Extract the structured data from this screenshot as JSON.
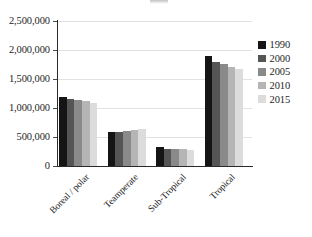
{
  "chart_data": {
    "type": "bar",
    "title": "",
    "subtitle": "",
    "xlabel": "",
    "ylabel": "",
    "categories": [
      "Boreal / polar",
      "Teamperate",
      "Sub-Tropical",
      "Tropical"
    ],
    "series": [
      {
        "name": "1990",
        "color": "#151515",
        "values": [
          1190000,
          580000,
          330000,
          1900000
        ]
      },
      {
        "name": "2000",
        "color": "#555555",
        "values": [
          1160000,
          590000,
          300000,
          1800000
        ]
      },
      {
        "name": "2005",
        "color": "#8a8a8a",
        "values": [
          1140000,
          600000,
          290000,
          1755000
        ]
      },
      {
        "name": "2010",
        "color": "#b5b5b5",
        "values": [
          1120000,
          615000,
          285000,
          1715000
        ]
      },
      {
        "name": "2015",
        "color": "#dcdcdc",
        "values": [
          1095000,
          630000,
          280000,
          1670000
        ]
      }
    ],
    "ylim": [
      0,
      2500000
    ],
    "yticks": [
      {
        "value": 2500000,
        "label": "2,500,000"
      },
      {
        "value": 2000000,
        "label": "2,000,000"
      },
      {
        "value": 1500000,
        "label": "1,500,000"
      },
      {
        "value": 1000000,
        "label": "1,000,000"
      },
      {
        "value": 500000,
        "label": "500,000"
      },
      {
        "value": 0,
        "label": "0"
      }
    ],
    "grid": true,
    "legend_position": "right"
  }
}
